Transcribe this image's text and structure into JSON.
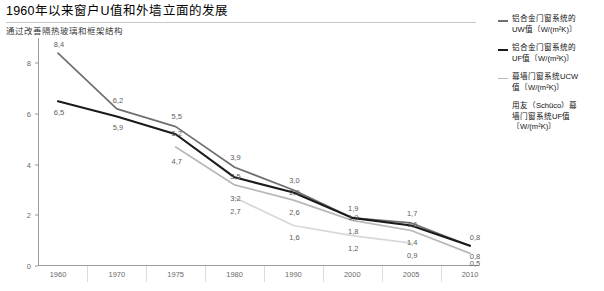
{
  "header": {
    "title": "1960年以来窗户U值和外墙立面的发展",
    "subtitle": "通过改善隔热玻璃和框架结构"
  },
  "legend": [
    {
      "line1": "铝合金门窗系统的",
      "line2": "UW值〔W/(m²K)〕",
      "color": "#6f6f6f"
    },
    {
      "line1": "铝合金门窗系统的",
      "line2": "UF值〔W/(m²K)〕",
      "color": "#1a1a1a"
    },
    {
      "line1": "幕墙门窗系统UCW",
      "line2": "值〔W/(m²K)〕",
      "color": "#b8b8b8"
    },
    {
      "line1": "用友（Schüco）幕",
      "line2": "墙门窗系统UF值",
      "line3": "〔W/(m²K)〕",
      "color": "#d8d8d8"
    }
  ],
  "chart_data": {
    "type": "line",
    "title": "1960年以来窗户U值和外墙立面的发展",
    "subtitle": "通过改善隔热玻璃和框架结构",
    "xlabel": "",
    "ylabel": "",
    "grid": false,
    "legend_position": "right",
    "categories": [
      "1960",
      "1970",
      "1975",
      "1980",
      "1990",
      "2000",
      "2005",
      "2010"
    ],
    "ylim": [
      0,
      9
    ],
    "yticks": [
      0,
      2,
      4,
      6,
      8
    ],
    "ytick_labels": [
      "0",
      "2",
      "4",
      "6",
      "8"
    ],
    "decimal_separator": ",",
    "series": [
      {
        "name": "铝合金门窗系统的UW值〔W/(m²K)〕",
        "color": "#6f6f6f",
        "values": [
          8.4,
          6.2,
          5.5,
          3.9,
          3.0,
          1.9,
          1.7,
          0.8
        ],
        "labels": [
          "8,4",
          "6,2",
          "5,5",
          "3,9",
          "3,0",
          "1,9",
          "1,7",
          "0,8"
        ]
      },
      {
        "name": "铝合金门窗系统的UF值〔W/(m²K)〕",
        "color": "#1a1a1a",
        "values": [
          6.5,
          5.9,
          5.2,
          3.5,
          2.9,
          1.9,
          1.6,
          0.8
        ],
        "labels": [
          "6,5",
          "5,9",
          "5,2",
          "3,5",
          "2,9",
          "1,9",
          "1,6",
          "0,8"
        ]
      },
      {
        "name": "幕墙门窗系统UCW值〔W/(m²K)〕",
        "color": "#b8b8b8",
        "values": [
          null,
          null,
          4.7,
          3.2,
          2.6,
          1.8,
          1.4,
          0.5
        ],
        "labels": [
          null,
          null,
          "4,7",
          "3,2",
          "2,6",
          "1,8",
          "1,4",
          "0,5"
        ]
      },
      {
        "name": "用友（Schüco）幕墙门窗系统UF值〔W/(m²K)〕",
        "color": "#d8d8d8",
        "values": [
          null,
          null,
          null,
          2.7,
          1.6,
          1.2,
          0.9,
          null
        ],
        "labels": [
          null,
          null,
          null,
          "2,7",
          "1,6",
          "1,2",
          "0,9",
          null
        ]
      }
    ]
  }
}
